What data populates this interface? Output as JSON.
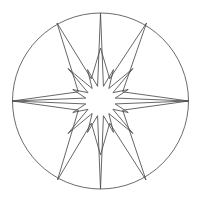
{
  "figure": {
    "background_color": "#ffffff",
    "stroke_color": "#4c4c4c",
    "circle_stroke_color": "#5a5a5a",
    "fill": "none",
    "stroke_width": 0.85,
    "canvas": {
      "width": 200,
      "height": 202
    }
  },
  "chart_data": {
    "type": "scatter",
    "xlabel": "",
    "ylabel": "",
    "grid": false,
    "legend": null,
    "xlim": [
      0,
      200
    ],
    "ylim": [
      0,
      202
    ],
    "shapes": [
      {
        "name": "bounding-circle",
        "kind": "circle",
        "cx": 100.5,
        "cy": 101.0,
        "r": 88.0
      },
      {
        "name": "star-polygon",
        "kind": "polygon",
        "center": [
          100.5,
          101.0
        ],
        "num_points": 16,
        "inner_radius": 15.0,
        "point_radii": [
          88.0,
          30.0,
          46.0,
          34.0,
          88.0,
          34.0,
          46.0,
          30.0,
          88.0,
          30.0,
          46.0,
          34.0,
          88.0,
          34.0,
          46.0,
          30.0
        ],
        "point_angles_deg": [
          0,
          22.5,
          45,
          67.5,
          90,
          112.5,
          135,
          157.5,
          180,
          202.5,
          225,
          247.5,
          270,
          292.5,
          315,
          337.5
        ],
        "inner_angles_deg": [
          11.25,
          33.75,
          56.25,
          78.75,
          101.25,
          123.75,
          146.25,
          168.75,
          191.25,
          213.75,
          236.25,
          258.75,
          281.25,
          303.75,
          326.25,
          348.75
        ],
        "tips": [
          {
            "label": "right-long",
            "x": 188.5,
            "y": 101.0
          },
          {
            "label": "upper-right-near-short",
            "x": 128.2,
            "y": 89.5
          },
          {
            "label": "upper-right-long",
            "x": 133.0,
            "y": 68.5
          },
          {
            "label": "up-right-short",
            "x": 113.5,
            "y": 69.6
          },
          {
            "label": "top-medium",
            "x": 100.5,
            "y": 55.0
          },
          {
            "label": "up-left-short",
            "x": 87.5,
            "y": 69.6
          },
          {
            "label": "upper-left-long",
            "x": 68.0,
            "y": 68.5
          },
          {
            "label": "upper-left-near-short",
            "x": 72.8,
            "y": 89.5
          },
          {
            "label": "left-long",
            "x": 12.5,
            "y": 101.0
          },
          {
            "label": "lower-left-near-short",
            "x": 72.8,
            "y": 112.5
          },
          {
            "label": "lower-left-long",
            "x": 68.0,
            "y": 133.5
          },
          {
            "label": "down-left-short",
            "x": 87.5,
            "y": 132.4
          },
          {
            "label": "bottom-medium",
            "x": 100.5,
            "y": 147.0
          },
          {
            "label": "down-right-short",
            "x": 113.5,
            "y": 132.4
          },
          {
            "label": "lower-right-long",
            "x": 133.0,
            "y": 133.5
          },
          {
            "label": "lower-right-near-short",
            "x": 128.2,
            "y": 112.5
          }
        ]
      },
      {
        "name": "long-spike-overlay",
        "kind": "polygon",
        "center": [
          100.5,
          101.0
        ],
        "num_points": 8,
        "outer_radius": 88.0,
        "inner_radius": 24.0,
        "start_angle_deg": 0,
        "tips": [
          {
            "label": "right",
            "x": 188.5,
            "y": 101.0
          },
          {
            "label": "upper-right",
            "x": 146.5,
            "y": 23.0
          },
          {
            "label": "top",
            "x": 100.5,
            "y": 48.0
          },
          {
            "label": "upper-left",
            "x": 57.0,
            "y": 23.0
          },
          {
            "label": "left",
            "x": 12.5,
            "y": 101.0
          },
          {
            "label": "lower-left",
            "x": 57.5,
            "y": 180.0
          },
          {
            "label": "bottom",
            "x": 100.5,
            "y": 155.0
          },
          {
            "label": "lower-right",
            "x": 146.0,
            "y": 180.0
          }
        ]
      }
    ]
  }
}
